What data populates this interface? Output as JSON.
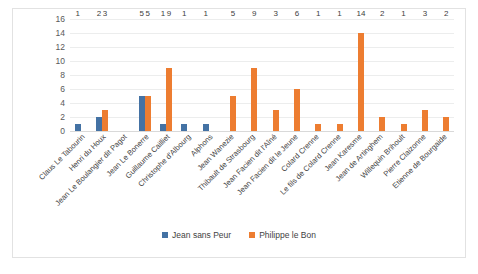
{
  "chart_data": {
    "type": "bar",
    "title": "",
    "xlabel": "",
    "ylabel": "",
    "ylim": [
      0,
      16
    ],
    "yticks": [
      16,
      14,
      12,
      10,
      8,
      6,
      4,
      2,
      0
    ],
    "grid": true,
    "legend_position": "bottom",
    "categories": [
      "Claus Le Tabourin",
      "Henri du Houx",
      "Jean Le Boulangier dit Pagot",
      "Jean Le Bonerre",
      "Guillaume Cailliet",
      "Christophe d'Albourg",
      "Alphons",
      "Jean Wanezie",
      "Thibault de Strasbourg",
      "Jean Facien dit l'Aîné",
      "Jean Facien dit le Jeune",
      "Colard Crenne",
      "Le fils de Colard Crenne",
      "Jean Karesme",
      "Jean de Artinghem",
      "Willequin Brihoult",
      "Pierre Claizonne",
      "Etienne de Bourgaide"
    ],
    "series": [
      {
        "name": "Jean sans Peur",
        "color": "#4472a4",
        "values": [
          1,
          2,
          null,
          5,
          1,
          1,
          1,
          null,
          null,
          null,
          null,
          null,
          null,
          null,
          null,
          null,
          null,
          null
        ]
      },
      {
        "name": "Philippe le Bon",
        "color": "#ed7d31",
        "values": [
          null,
          3,
          null,
          5,
          9,
          null,
          null,
          5,
          9,
          3,
          6,
          1,
          1,
          14,
          2,
          1,
          3,
          2
        ]
      }
    ]
  },
  "legend": {
    "items": [
      {
        "label": "Jean sans Peur",
        "color": "#4472a4"
      },
      {
        "label": "Philippe le Bon",
        "color": "#ed7d31"
      }
    ]
  },
  "colors": {
    "series_blue": "#4472a4",
    "series_orange": "#ed7d31",
    "gridline": "#eceded",
    "axis_text": "#595959",
    "frame_border": "#e2e2e2",
    "background": "#ffffff"
  }
}
